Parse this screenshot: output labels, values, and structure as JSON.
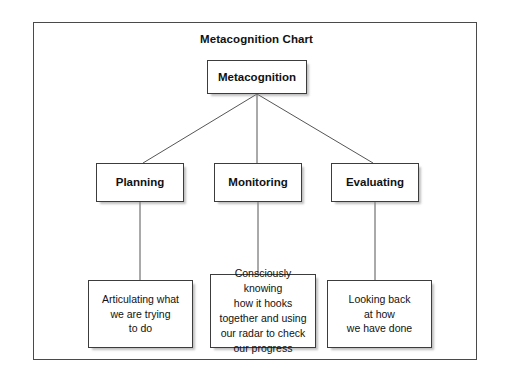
{
  "chart": {
    "title": "Metacognition Chart",
    "root": {
      "label": "Metacognition"
    },
    "branches": [
      {
        "label": "Planning",
        "detail": "Articulating what\nwe are trying\nto do"
      },
      {
        "label": "Monitoring",
        "detail": "Consciously knowing\nhow it hooks\ntogether and using\nour radar to check\nour progress"
      },
      {
        "label": "Evaluating",
        "detail": "Looking back\nat how\nwe have done"
      }
    ]
  },
  "style": {
    "frame_border_color": "#4a4a4a",
    "box_border_color": "#3c3c3c",
    "connector_color": "#555555",
    "text_color": "#111111",
    "background": "#ffffff"
  }
}
